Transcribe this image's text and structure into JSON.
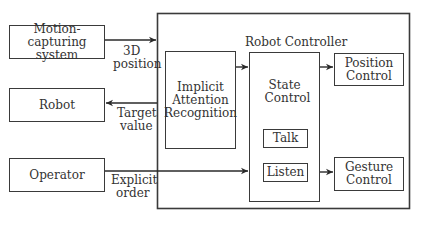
{
  "diagram": {
    "outer_title": "Robot Controller",
    "nodes": {
      "motion": "Motion-capturing system",
      "robot": "Robot",
      "operator": "Operator",
      "implicit": "Implicit Attention Recognition",
      "state": "State Control",
      "talk": "Talk",
      "listen": "Listen",
      "position": "Position Control",
      "gesture": "Gesture Control"
    },
    "edge_labels": {
      "pos3d_1": "3D",
      "pos3d_2": "position",
      "target_1": "Target",
      "target_2": "value",
      "explicit_1": "Explicit",
      "explicit_2": "order"
    },
    "edges": [
      {
        "from": "motion",
        "to": "robot-controller",
        "label": "3D position"
      },
      {
        "from": "robot-controller",
        "to": "robot",
        "label": "Target value"
      },
      {
        "from": "operator",
        "to": "state",
        "label": "Explicit order"
      },
      {
        "from": "implicit",
        "to": "state"
      },
      {
        "from": "state",
        "to": "position"
      },
      {
        "from": "state",
        "to": "gesture"
      },
      {
        "from": "talk",
        "to": "listen"
      },
      {
        "from": "listen",
        "to": "talk"
      }
    ]
  }
}
